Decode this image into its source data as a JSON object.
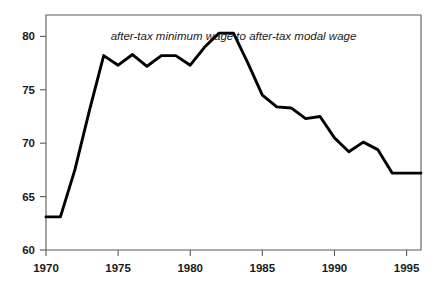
{
  "chart_data": {
    "type": "line",
    "title": "after-tax minimum wage to after-tax modal wage",
    "xlabel": "",
    "ylabel": "",
    "xlim": [
      1970,
      1996
    ],
    "ylim": [
      60,
      82
    ],
    "grid": false,
    "legend_position": "none",
    "x_ticks": [
      "1970",
      "1975",
      "1980",
      "1985",
      "1990",
      "1995"
    ],
    "x_tick_values": [
      1970,
      1975,
      1980,
      1985,
      1990,
      1995
    ],
    "y_ticks": [
      "60",
      "65",
      "70",
      "75",
      "80"
    ],
    "y_tick_values": [
      60,
      65,
      70,
      75,
      80
    ],
    "x": [
      1970,
      1971,
      1972,
      1973,
      1974,
      1975,
      1976,
      1977,
      1978,
      1979,
      1980,
      1981,
      1982,
      1983,
      1984,
      1985,
      1986,
      1987,
      1988,
      1989,
      1990,
      1991,
      1992,
      1993,
      1994,
      1995,
      1996
    ],
    "values": [
      63.1,
      63.1,
      67.5,
      73.0,
      78.2,
      77.3,
      78.3,
      77.2,
      78.2,
      78.2,
      77.3,
      79.0,
      80.3,
      80.3,
      77.5,
      74.5,
      73.4,
      73.3,
      72.3,
      72.5,
      70.5,
      69.2,
      70.1,
      69.4,
      67.2,
      67.2,
      67.2
    ],
    "series": [
      {
        "name": "after-tax minimum wage to after-tax modal wage",
        "color": "#000000",
        "values": [
          63.1,
          63.1,
          67.5,
          73.0,
          78.2,
          77.3,
          78.3,
          77.2,
          78.2,
          78.2,
          77.3,
          79.0,
          80.3,
          80.3,
          77.5,
          74.5,
          73.4,
          73.3,
          72.3,
          72.5,
          70.5,
          69.2,
          70.1,
          69.4,
          67.2,
          67.2,
          67.2
        ]
      }
    ]
  },
  "colors": {
    "line": "#000000",
    "frame": "#5a5a5a",
    "text": "#1a1a1a",
    "background": "#ffffff"
  }
}
